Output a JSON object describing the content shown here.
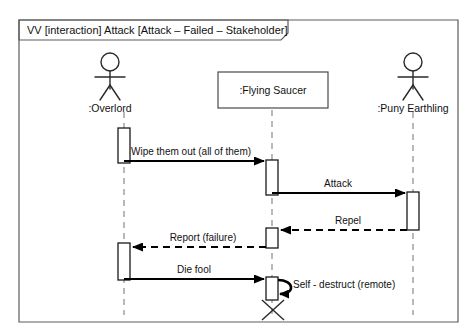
{
  "frame": {
    "label": "VV [interaction] Attack [Attack – Failed – Stakeholder]"
  },
  "lifelines": [
    {
      "id": "overlord",
      "name": ":Overlord",
      "kind": "actor"
    },
    {
      "id": "saucer",
      "name": ":Flying Saucer",
      "kind": "object"
    },
    {
      "id": "earthling",
      "name": ":Puny Earthling",
      "kind": "actor"
    }
  ],
  "messages": [
    {
      "id": "m1",
      "label": "Wipe them out (all of them)",
      "from": "overlord",
      "to": "saucer",
      "style": "solid",
      "direction": "right"
    },
    {
      "id": "m2",
      "label": "Attack",
      "from": "saucer",
      "to": "earthling",
      "style": "solid",
      "direction": "right"
    },
    {
      "id": "m3",
      "label": "Repel",
      "from": "earthling",
      "to": "saucer",
      "style": "dashed",
      "direction": "left"
    },
    {
      "id": "m4",
      "label": "Report (failure)",
      "from": "saucer",
      "to": "overlord",
      "style": "dashed",
      "direction": "left"
    },
    {
      "id": "m5",
      "label": "Die fool",
      "from": "overlord",
      "to": "saucer",
      "style": "solid",
      "direction": "right"
    },
    {
      "id": "m6",
      "label": "Self - destruct (remote)",
      "from": "saucer",
      "to": "saucer",
      "style": "self",
      "direction": "self"
    }
  ],
  "colors": {
    "frame_stroke": "#5c5c5c",
    "lifeline_stroke": "#8a8a8a",
    "message_stroke": "#000000",
    "background": "#ffffff"
  }
}
